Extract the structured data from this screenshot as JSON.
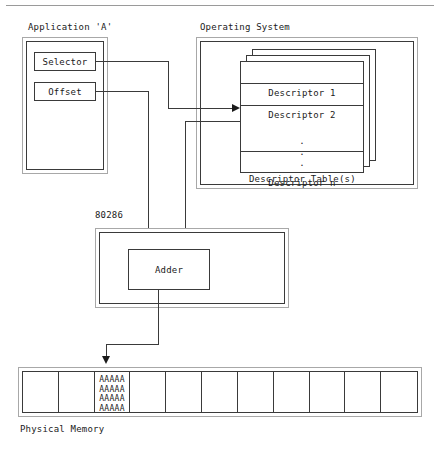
{
  "diagram": {
    "title_top_rule": true,
    "application": {
      "label": "Application 'A'",
      "fields": [
        {
          "name": "selector",
          "label": "Selector"
        },
        {
          "name": "offset",
          "label": "Offset"
        }
      ]
    },
    "operating_system": {
      "label": "Operating System",
      "table_caption": "Descriptor Table(s)",
      "sheet_count": 3,
      "rows": [
        {
          "name": "descriptor-1",
          "label": "Descriptor 1"
        },
        {
          "name": "descriptor-2",
          "label": "Descriptor 2"
        },
        {
          "name": "descriptor-n",
          "label": "Descriptor n"
        }
      ],
      "ellipsis": "."
    },
    "cpu": {
      "label": "80286",
      "unit": {
        "name": "adder",
        "label": "Adder"
      }
    },
    "memory": {
      "label": "Physical Memory",
      "cell_count": 11,
      "filled_cell_index": 2,
      "filled_cell_content": "AAAAA\nAAAAA\nAAAAA\nAAAAA"
    },
    "colors": {
      "line": "#3a3a3a",
      "outer_line": "#a8a8a8",
      "text": "#1a1a1a",
      "background": "#ffffff"
    }
  }
}
